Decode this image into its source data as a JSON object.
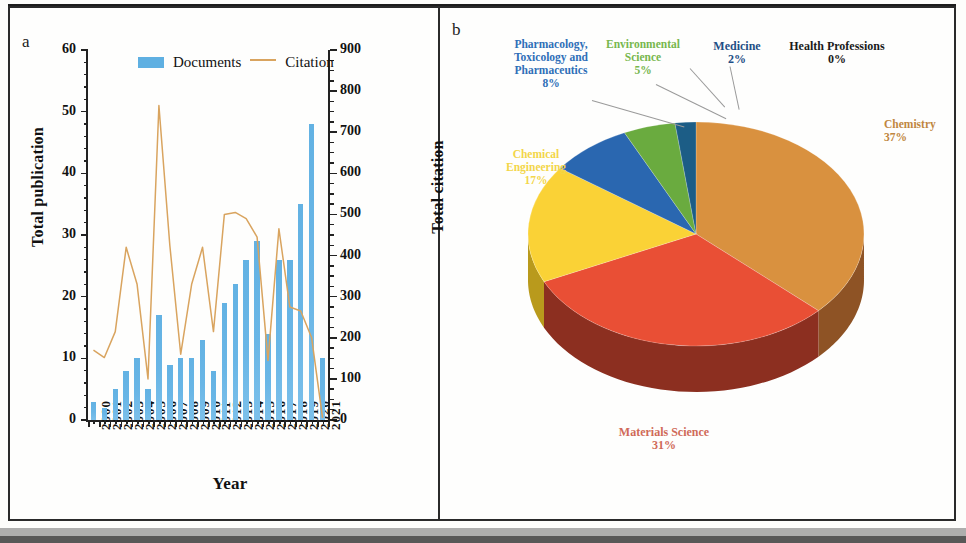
{
  "figure": {
    "panel_a_letter": "a",
    "panel_b_letter": "b"
  },
  "panel_a": {
    "xlabel": "Year",
    "ylabel_left": "Total publication",
    "ylabel_right": "Total citation",
    "legend": [
      {
        "label": "Documents",
        "type": "bar",
        "color": "#5fb0e2"
      },
      {
        "label": "Citation",
        "type": "line",
        "color": "#d9a45f"
      }
    ],
    "yticks_left": [
      "0",
      "10",
      "20",
      "30",
      "40",
      "50",
      "60"
    ],
    "yticks_right": [
      "0",
      "100",
      "200",
      "300",
      "400",
      "500",
      "600",
      "700",
      "800",
      "900"
    ]
  },
  "panel_b": {
    "slices": [
      {
        "name": "Chemistry",
        "pct": "37%",
        "value": 37,
        "color": "#d9913f",
        "side_color": "#8e5325",
        "label_color": "#c08640"
      },
      {
        "name": "Materials Science",
        "pct": "31%",
        "value": 31,
        "color": "#e94f35",
        "side_color": "#8c2f20",
        "label_color": "#d06a58"
      },
      {
        "name": "Chemical Engineering",
        "pct": "17%",
        "value": 17,
        "color": "#fad236",
        "side_color": "#b99a1c",
        "label_color": "#f3d64a"
      },
      {
        "name": "Pharmacology, Toxicology and Pharmaceutics",
        "pct": "8%",
        "value": 8,
        "color": "#2a67b0",
        "side_color": "#1b4273",
        "label_color": "#2f6fb8"
      },
      {
        "name": "Environmental Science",
        "pct": "5%",
        "value": 5,
        "color": "#6aab3f",
        "side_color": "#436c27",
        "label_color": "#77b74d"
      },
      {
        "name": "Medicine",
        "pct": "2%",
        "value": 2,
        "color": "#1c5d86",
        "side_color": "#123c57",
        "label_color": "#1f4f86"
      },
      {
        "name": "Health Professions",
        "pct": "0%",
        "value": 0,
        "color": "#245f8c",
        "side_color": "#143a56",
        "label_color": "#1b1b1b"
      }
    ]
  },
  "chart_data": [
    {
      "type": "bar",
      "title": "",
      "panel": "a",
      "xlabel": "Year",
      "ylabel": "Total publication",
      "y2label": "Total citation",
      "ylim": [
        0,
        60
      ],
      "y2lim": [
        0,
        900
      ],
      "grid": false,
      "legend_position": "top-center",
      "categories": [
        "2000",
        "2001",
        "2002",
        "2003",
        "2004",
        "2005",
        "2006",
        "2007",
        "2008",
        "2009",
        "2010",
        "2011",
        "2012",
        "2013",
        "2014",
        "2015",
        "2016",
        "2017",
        "2018",
        "2019",
        "2020",
        "2021"
      ],
      "series": [
        {
          "name": "Documents",
          "type": "bar",
          "axis": "left",
          "color": "#5fb0e2",
          "values": [
            3,
            2,
            5,
            8,
            10,
            5,
            17,
            9,
            10,
            10,
            13,
            8,
            19,
            22,
            26,
            29,
            14,
            26,
            26,
            35,
            48,
            10
          ]
        },
        {
          "name": "Citation",
          "type": "line",
          "axis": "right",
          "color": "#d9a45f",
          "values": [
            170,
            152,
            215,
            420,
            330,
            100,
            765,
            425,
            160,
            330,
            420,
            215,
            500,
            505,
            490,
            445,
            145,
            465,
            275,
            265,
            200,
            5
          ]
        }
      ]
    },
    {
      "type": "pie",
      "panel": "b",
      "title": "",
      "labels": [
        "Chemistry",
        "Materials Science",
        "Chemical Engineering",
        "Pharmacology, Toxicology and Pharmaceutics",
        "Environmental Science",
        "Medicine",
        "Health Professions"
      ],
      "values": [
        37,
        31,
        17,
        8,
        5,
        2,
        0
      ],
      "pct_labels": [
        "37%",
        "31%",
        "17%",
        "8%",
        "5%",
        "2%",
        "0%"
      ],
      "colors": [
        "#d9913f",
        "#e94f35",
        "#fad236",
        "#2a67b0",
        "#6aab3f",
        "#1c5d86",
        "#245f8c"
      ],
      "three_d": true,
      "legend_position": "none"
    }
  ]
}
